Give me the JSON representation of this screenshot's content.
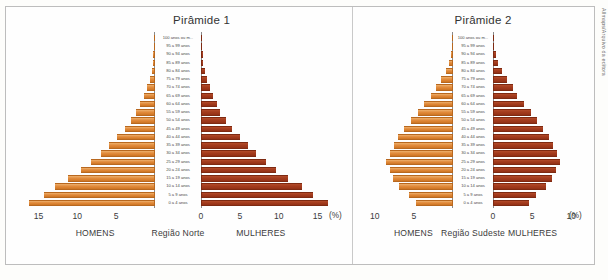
{
  "figure": {
    "credit": "Allmaps/Arquivo da editora",
    "male_color": "#E08A3C",
    "female_color": "#A33B1D",
    "percent_symbol": "(%)",
    "age_groups": [
      "0 a 4 anos",
      "5 a 9 anos",
      "10 a 14 anos",
      "15 a 19 anos",
      "20 a 24 anos",
      "25 a 29 anos",
      "30 a 34 anos",
      "35 a 39 anos",
      "40 a 44 anos",
      "45 a 49 anos",
      "50 a 54 anos",
      "55 a 59 anos",
      "60 a 64 anos",
      "65 a 69 anos",
      "70 a 74 anos",
      "75 a 79 anos",
      "80 a 84 anos",
      "85 a 89 anos",
      "90 a 94 anos",
      "95 a 99 anos",
      "100 anos ou m..."
    ]
  },
  "charts": [
    {
      "title": "Pirâmide 1",
      "left_label": "HOMENS",
      "center_label": "Região Norte",
      "right_label": "MULHERES",
      "ticks_left": [
        "15",
        "10",
        "5"
      ],
      "ticks_right": [
        "0",
        "5",
        "10",
        "15"
      ],
      "axis_max": 17.5
    },
    {
      "title": "Pirâmide 2",
      "left_label": "HOMENS",
      "center_label": "Região Sudeste",
      "right_label": "MULHERES",
      "ticks_left": [
        "10",
        "5"
      ],
      "ticks_right": [
        "0",
        "5",
        "10"
      ],
      "axis_max": 11.5
    }
  ],
  "chart_data": [
    {
      "type": "bar",
      "title": "Pirâmide 1",
      "subtitle": "Região Norte",
      "orientation": "horizontal-diverging",
      "xlabel": "(%)",
      "ylabel": "",
      "grid": false,
      "legend": "none",
      "xlim": [
        -17.5,
        17.5
      ],
      "xticks_left": [
        15,
        10,
        5
      ],
      "xticks_right": [
        0,
        5,
        10,
        15
      ],
      "categories": [
        "0 a 4 anos",
        "5 a 9 anos",
        "10 a 14 anos",
        "15 a 19 anos",
        "20 a 24 anos",
        "25 a 29 anos",
        "30 a 34 anos",
        "35 a 39 anos",
        "40 a 44 anos",
        "45 a 49 anos",
        "50 a 54 anos",
        "55 a 59 anos",
        "60 a 64 anos",
        "65 a 69 anos",
        "70 a 74 anos",
        "75 a 79 anos",
        "80 a 84 anos",
        "85 a 89 anos",
        "90 a 94 anos",
        "95 a 99 anos",
        "100 anos ou m..."
      ],
      "series": [
        {
          "name": "HOMENS",
          "side": "left",
          "color": "#E08A3C",
          "values": [
            16.2,
            14.3,
            12.9,
            11.2,
            9.5,
            8.2,
            7.0,
            5.9,
            4.9,
            3.9,
            3.1,
            2.4,
            1.9,
            1.4,
            1.0,
            0.7,
            0.45,
            0.3,
            0.2,
            0.12,
            0.06
          ]
        },
        {
          "name": "MULHERES",
          "side": "right",
          "color": "#A33B1D",
          "values": [
            16.3,
            14.4,
            13.0,
            11.2,
            9.6,
            8.3,
            7.1,
            6.0,
            5.0,
            4.0,
            3.2,
            2.5,
            2.0,
            1.5,
            1.1,
            0.75,
            0.5,
            0.32,
            0.2,
            0.12,
            0.06
          ]
        }
      ]
    },
    {
      "type": "bar",
      "title": "Pirâmide 2",
      "subtitle": "Região Sudeste",
      "orientation": "horizontal-diverging",
      "xlabel": "(%)",
      "ylabel": "",
      "grid": false,
      "legend": "none",
      "xlim": [
        -11.5,
        11.5
      ],
      "xticks_left": [
        10,
        5
      ],
      "xticks_right": [
        0,
        5,
        10
      ],
      "categories": [
        "0 a 4 anos",
        "5 a 9 anos",
        "10 a 14 anos",
        "15 a 19 anos",
        "20 a 24 anos",
        "25 a 29 anos",
        "30 a 34 anos",
        "35 a 39 anos",
        "40 a 44 anos",
        "45 a 49 anos",
        "50 a 54 anos",
        "55 a 59 anos",
        "60 a 64 anos",
        "65 a 69 anos",
        "70 a 74 anos",
        "75 a 79 anos",
        "80 a 84 anos",
        "85 a 89 anos",
        "90 a 94 anos",
        "95 a 99 anos",
        "100 anos ou m..."
      ],
      "series": [
        {
          "name": "HOMENS",
          "side": "left",
          "color": "#E08A3C",
          "values": [
            4.7,
            5.6,
            6.9,
            7.7,
            8.1,
            8.6,
            8.1,
            7.6,
            7.0,
            6.2,
            5.4,
            4.5,
            3.7,
            2.8,
            2.2,
            1.5,
            0.95,
            0.5,
            0.25,
            0.12,
            0.06
          ]
        },
        {
          "name": "MULHERES",
          "side": "right",
          "color": "#A33B1D",
          "values": [
            4.6,
            5.5,
            6.8,
            7.6,
            8.0,
            8.5,
            8.2,
            7.7,
            7.2,
            6.4,
            5.6,
            4.8,
            4.0,
            3.1,
            2.5,
            1.8,
            1.2,
            0.7,
            0.35,
            0.16,
            0.08
          ]
        }
      ]
    }
  ]
}
